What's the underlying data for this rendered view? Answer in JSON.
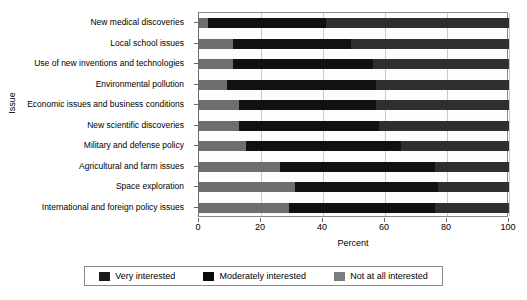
{
  "chart_data": {
    "type": "bar",
    "orientation": "horizontal",
    "stacked": true,
    "stack_total": 100,
    "title": "",
    "xlabel": "Percent",
    "ylabel": "Issue",
    "xlim": [
      0,
      100
    ],
    "xticks": [
      0,
      20,
      40,
      60,
      80,
      100
    ],
    "xtick_labels": [
      "0",
      "20",
      "40",
      "60",
      "80",
      "100"
    ],
    "grid": true,
    "grid_axis": "x",
    "legend_position": "bottom",
    "categories": [
      "New medical discoveries",
      "Local school issues",
      "Use of new inventions and technologies",
      "Environmental pollution",
      "Economic issues and business conditions",
      "New scientific discoveries",
      "Military and defense policy",
      "Agricultural and farm issues",
      "Space exploration",
      "International and foreign policy issues"
    ],
    "series": [
      {
        "name": "Very interested",
        "color": "#6e6e6e",
        "values": [
          3,
          11,
          11,
          9,
          13,
          13,
          15,
          26,
          31,
          29
        ]
      },
      {
        "name": "Moderately interested",
        "color": "#111111",
        "values": [
          38,
          38,
          45,
          48,
          44,
          45,
          50,
          50,
          46,
          47
        ]
      },
      {
        "name": "Not at all interested",
        "color": "#2f2f2f",
        "values": [
          59,
          51,
          44,
          43,
          43,
          42,
          35,
          24,
          23,
          24
        ]
      }
    ]
  },
  "legend": {
    "items": [
      {
        "label": "Very interested",
        "color": "#1a1a1a"
      },
      {
        "label": "Moderately interested",
        "color": "#0a0a0a"
      },
      {
        "label": "Not at all interested",
        "color": "#7d7d7d"
      }
    ]
  }
}
